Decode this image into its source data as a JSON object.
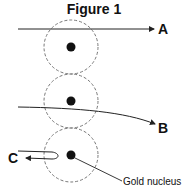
{
  "title": "Figure 1",
  "labels": {
    "a": "A",
    "b": "B",
    "c": "C",
    "nucleus": "Gold nucleus"
  },
  "colors": {
    "stroke": "#222222",
    "dashed_circle": "#777777"
  }
}
